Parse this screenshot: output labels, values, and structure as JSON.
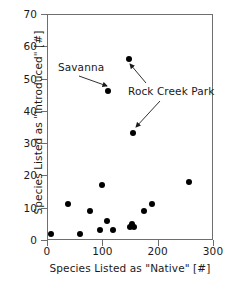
{
  "chart_data": {
    "type": "scatter",
    "title": "",
    "xlabel": "Species Listed as \"Native\" [#]",
    "ylabel": "Species Listed as \"Introduced\" [#]",
    "xlim": [
      0,
      300
    ],
    "ylim": [
      0,
      70
    ],
    "xticks": [
      0,
      100,
      200,
      300
    ],
    "yticks": [
      0,
      10,
      20,
      30,
      40,
      50,
      60,
      70
    ],
    "xtick_labels": [
      "0",
      "100",
      "200",
      "300"
    ],
    "ytick_labels": [
      "0",
      "10",
      "20",
      "30",
      "40",
      "50",
      "60",
      "70"
    ],
    "grid": false,
    "legend": null,
    "marker_color": "#000000",
    "marker_shape": "circle",
    "axis_color": "#6e6e6e",
    "points": [
      {
        "x": 8,
        "y": 2,
        "label": ""
      },
      {
        "x": 38,
        "y": 11,
        "label": ""
      },
      {
        "x": 60,
        "y": 2,
        "label": ""
      },
      {
        "x": 78,
        "y": 9,
        "label": ""
      },
      {
        "x": 95,
        "y": 3,
        "label": ""
      },
      {
        "x": 100,
        "y": 17,
        "label": ""
      },
      {
        "x": 108,
        "y": 6,
        "label": ""
      },
      {
        "x": 110,
        "y": 46,
        "label": "Savanna"
      },
      {
        "x": 120,
        "y": 3,
        "label": ""
      },
      {
        "x": 148,
        "y": 56,
        "label": "Rock Creek Park"
      },
      {
        "x": 150,
        "y": 4,
        "label": ""
      },
      {
        "x": 153,
        "y": 5,
        "label": ""
      },
      {
        "x": 155,
        "y": 33,
        "label": "Rock Creek Park"
      },
      {
        "x": 158,
        "y": 4,
        "label": ""
      },
      {
        "x": 175,
        "y": 9,
        "label": ""
      },
      {
        "x": 190,
        "y": 11,
        "label": ""
      },
      {
        "x": 257,
        "y": 18,
        "label": ""
      }
    ],
    "annotations": [
      {
        "id": "savanna",
        "text": "Savanna",
        "text_x": 58,
        "text_y": 62,
        "arrow_from_x": 79,
        "arrow_from_y": 76,
        "arrow_to_x": 107,
        "arrow_to_y": 86
      },
      {
        "id": "rock-creek-park",
        "text": "Rock Creek Park",
        "text_x": 128,
        "text_y": 86,
        "arrow_from_x": 146,
        "arrow_from_y": 83,
        "arrow_to_x": 130,
        "arrow_to_y": 64
      },
      {
        "id": "rock-creek-park-second-arrow",
        "text": "",
        "text_x": 0,
        "text_y": 0,
        "arrow_from_x": 160,
        "arrow_from_y": 101,
        "arrow_to_x": 136,
        "arrow_to_y": 127
      }
    ]
  }
}
